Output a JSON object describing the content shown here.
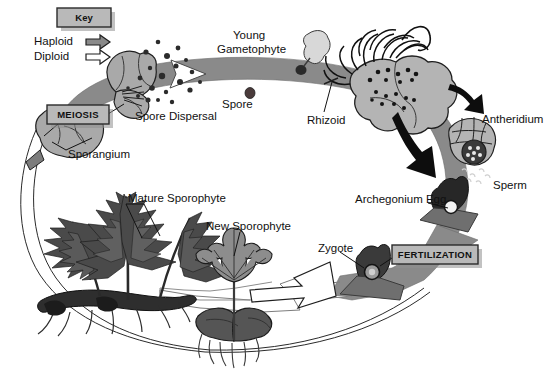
{
  "diagram": {
    "background_color": "#ffffff",
    "colors": {
      "band_haploid": "#8a8a8a",
      "band_diploid_outline": "#9a9a9a",
      "gametophyte_light": "#b4b4b4",
      "gametophyte_dark": "#2a2a2a",
      "sporophyte_dark": "#3c3c3c",
      "box_fill": "#b9b9b9",
      "box_border": "#2b2b2b",
      "ink": "#111111",
      "spore_dark": "#2b2b2b"
    }
  },
  "key": {
    "title": "Key",
    "items": [
      {
        "label": "Haploid",
        "arrow_style": "filled",
        "arrow_fill": "#8a8a8a"
      },
      {
        "label": "Diploid",
        "arrow_style": "outline",
        "arrow_fill": "#ffffff"
      }
    ]
  },
  "stage_boxes": [
    {
      "label": "MEIOSIS",
      "x": 47,
      "y": 105
    },
    {
      "label": "FERTILIZATION",
      "x": 392,
      "y": 245
    }
  ],
  "labels": [
    {
      "name": "young-gametophyte",
      "text_lines": [
        "Young",
        "Gametophyte"
      ],
      "x": 233,
      "y": 30
    },
    {
      "name": "spore-dispersal",
      "text_lines": [
        "Spore Dispersal"
      ],
      "x": 135,
      "y": 115
    },
    {
      "name": "spore",
      "text_lines": [
        "Spore"
      ],
      "x": 232,
      "y": 102
    },
    {
      "name": "rhizoid",
      "text_lines": [
        "Rhizoid"
      ],
      "x": 307,
      "y": 118
    },
    {
      "name": "antheridium",
      "text_lines": [
        "Antheridium"
      ],
      "x": 482,
      "y": 117
    },
    {
      "name": "sperm",
      "text_lines": [
        "Sperm"
      ],
      "x": 493,
      "y": 183
    },
    {
      "name": "archegonium-egg",
      "text_lines": [
        "Archegonium Egg"
      ],
      "x": 358,
      "y": 199
    },
    {
      "name": "zygote",
      "text_lines": [
        "Zygote"
      ],
      "x": 320,
      "y": 246
    },
    {
      "name": "sporangium",
      "text_lines": [
        "Sporangium"
      ],
      "x": 68,
      "y": 152
    },
    {
      "name": "mature-sporophyte",
      "text_lines": [
        "Mature Sporophyte"
      ],
      "x": 128,
      "y": 198
    },
    {
      "name": "new-sporophyte",
      "text_lines": [
        "New Sporophyte"
      ],
      "x": 208,
      "y": 225
    }
  ]
}
